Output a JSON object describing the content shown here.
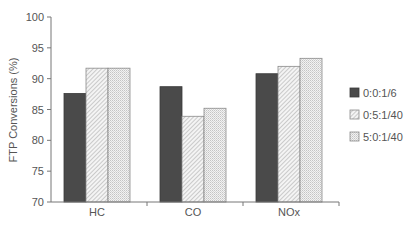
{
  "chart_data": {
    "type": "bar",
    "title": "",
    "xlabel": "",
    "ylabel": "FTP Conversions (%)",
    "ylim": [
      70,
      100
    ],
    "yticks": [
      70,
      75,
      80,
      85,
      90,
      95,
      100
    ],
    "categories": [
      "HC",
      "CO",
      "NOx"
    ],
    "series": [
      {
        "name": "0:0:1/6",
        "pattern": "solid-dark",
        "color": "#4a4a4a",
        "values": [
          87.6,
          88.7,
          90.8
        ]
      },
      {
        "name": "0:5:1/40",
        "pattern": "diagonal-hatch",
        "color": "#bdbdbd",
        "values": [
          91.7,
          83.9,
          92.0
        ]
      },
      {
        "name": "5:0:1/40",
        "pattern": "fine-dots",
        "color": "#cfcfcf",
        "values": [
          91.7,
          85.2,
          93.3
        ]
      }
    ],
    "grid": false,
    "legend_position": "right"
  }
}
